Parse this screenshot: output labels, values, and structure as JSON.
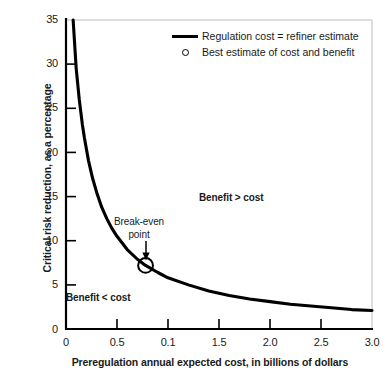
{
  "chart_data": {
    "type": "line",
    "title": "",
    "xlabel": "Preregulation annual expected cost, in billions of dollars",
    "ylabel": "Critical risk reduction, as a percentage",
    "xlim": [
      0,
      3.0
    ],
    "ylim": [
      0,
      35
    ],
    "xticks": [
      "0",
      "0.5",
      "0.1",
      "1.5",
      "2.0",
      "2.5",
      "3.0"
    ],
    "xtick_values": [
      0,
      0.5,
      1.0,
      1.5,
      2.0,
      2.5,
      3.0
    ],
    "yticks": [
      "0",
      "5",
      "10",
      "15",
      "20",
      "25",
      "30",
      "35"
    ],
    "ytick_values": [
      0,
      5,
      10,
      15,
      20,
      25,
      30,
      35
    ],
    "grid": false,
    "legend_position": "top-right",
    "series": [
      {
        "name": "Regulation cost = refiner estimate",
        "type": "line",
        "x": [
          0.07,
          0.1,
          0.13,
          0.16,
          0.18,
          0.22,
          0.26,
          0.3,
          0.35,
          0.4,
          0.45,
          0.5,
          0.6,
          0.7,
          0.78,
          0.9,
          1.0,
          1.2,
          1.4,
          1.6,
          1.8,
          2.0,
          2.2,
          2.4,
          2.6,
          2.8,
          3.0
        ],
        "y": [
          35.0,
          29.5,
          26.0,
          23.2,
          21.7,
          19.1,
          17.1,
          15.5,
          13.8,
          12.5,
          11.4,
          10.5,
          9.0,
          7.9,
          7.2,
          6.4,
          5.8,
          5.0,
          4.3,
          3.8,
          3.4,
          3.1,
          2.8,
          2.6,
          2.4,
          2.2,
          2.1
        ]
      }
    ],
    "markers": [
      {
        "name": "Best estimate of cost and benefit",
        "style": "open-circle",
        "x": 0.78,
        "y": 7.2
      }
    ],
    "annotations": [
      {
        "name": "break-even-point",
        "text": "Break-even\npoint",
        "x": 0.78,
        "y": 14.5
      },
      {
        "name": "benefit-greater-than-cost",
        "text": "Benefit > cost",
        "x": 1.35,
        "y": 16.0
      },
      {
        "name": "benefit-less-than-cost",
        "text": "Benefit < cost",
        "x": 0.03,
        "y": 4.5
      }
    ]
  },
  "axes": {
    "ylabel": "Critical risk reduction, as a percentage",
    "xlabel": "Preregulation annual expected cost, in billions of dollars",
    "yticks": [
      "35",
      "30",
      "25",
      "20",
      "15",
      "10",
      "5",
      "0"
    ],
    "xticks": [
      "0",
      "0.5",
      "0.1",
      "1.5",
      "2.0",
      "2.5",
      "3.0"
    ]
  },
  "legend": {
    "items": [
      {
        "key": "line",
        "label": "Regulation cost = refiner estimate"
      },
      {
        "key": "circle",
        "label": "Best estimate of cost and benefit"
      }
    ]
  },
  "annotations": {
    "breakeven_line1": "Break-even",
    "breakeven_line2": "point",
    "benefit_above": "Benefit > cost",
    "benefit_below": "Benefit < cost"
  },
  "colors": {
    "curve": "#000000",
    "axis": "#000000",
    "frame": "#b8b8b8",
    "text": "#1a1a1a",
    "background": "#ffffff"
  }
}
